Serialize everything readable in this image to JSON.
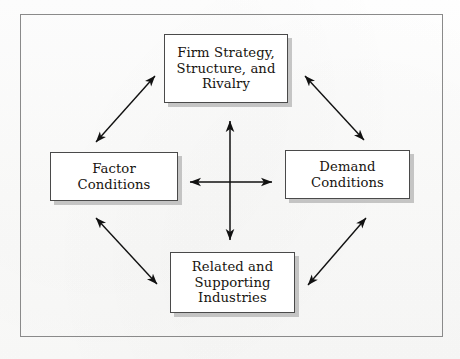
{
  "diagram": {
    "frame": {
      "border_color": "#8a8a8a",
      "background_color": "#fcfcfb"
    },
    "box_style": {
      "fill": "#ffffff",
      "border_color": "#4a4a4a",
      "shadow_color": "#9b9b9b"
    },
    "arrow_color": "#111111",
    "nodes": [
      {
        "id": "firm-strategy",
        "label": "Firm Strategy,\nStructure, and\nRivalry",
        "position": "top"
      },
      {
        "id": "factor-conditions",
        "label": "Factor\nConditions",
        "position": "left"
      },
      {
        "id": "demand-conditions",
        "label": "Demand\nConditions",
        "position": "right"
      },
      {
        "id": "related-supporting",
        "label": "Related and\nSupporting\nIndustries",
        "position": "bottom"
      }
    ],
    "connectors": [
      {
        "id": "center-vertical",
        "from": "firm-strategy",
        "to": "related-supporting",
        "style": "double-headed",
        "orientation": "vertical"
      },
      {
        "id": "center-horizontal",
        "from": "factor-conditions",
        "to": "demand-conditions",
        "style": "double-headed",
        "orientation": "horizontal"
      },
      {
        "id": "diagonal-top-left",
        "from": "factor-conditions",
        "to": "firm-strategy",
        "style": "double-headed",
        "orientation": "diagonal"
      },
      {
        "id": "diagonal-top-right",
        "from": "firm-strategy",
        "to": "demand-conditions",
        "style": "double-headed",
        "orientation": "diagonal"
      },
      {
        "id": "diagonal-bottom-left",
        "from": "factor-conditions",
        "to": "related-supporting",
        "style": "double-headed",
        "orientation": "diagonal"
      },
      {
        "id": "diagonal-bottom-right",
        "from": "related-supporting",
        "to": "demand-conditions",
        "style": "double-headed",
        "orientation": "diagonal"
      }
    ]
  }
}
